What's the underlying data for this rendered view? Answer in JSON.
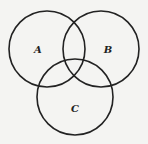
{
  "diagram": {
    "type": "venn",
    "background": "#f4f4f2",
    "stroke_color": "#222222",
    "sets": [
      {
        "label": "A",
        "cx": 47,
        "cy": 49,
        "r": 38,
        "label_x": 38,
        "label_y": 53
      },
      {
        "label": "B",
        "cx": 101,
        "cy": 49,
        "r": 38,
        "label_x": 108,
        "label_y": 53
      },
      {
        "label": "C",
        "cx": 75,
        "cy": 97,
        "r": 38,
        "label_x": 75,
        "label_y": 112
      }
    ]
  }
}
